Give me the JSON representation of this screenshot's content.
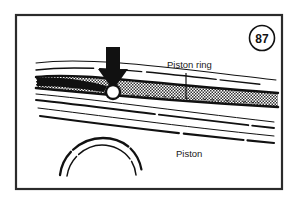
{
  "figure": {
    "number": "87",
    "frame_color": "#2b2b2b",
    "background_color": "#ffffff",
    "ink_color": "#111111",
    "ring_fill_color": "#9a9a9a"
  },
  "labels": {
    "piston_ring": "Piston ring",
    "piston": "Piston"
  },
  "callouts": {
    "arrow_icon": "down-arrow-icon",
    "arrow_color": "#111111",
    "highlight_icon": "circle-highlight-icon"
  },
  "parts": {
    "ring_band_name": "piston-ring-band",
    "piston_land_lines_name": "piston-land-lines",
    "piston_crown_arcs_name": "piston-crown-arcs"
  }
}
